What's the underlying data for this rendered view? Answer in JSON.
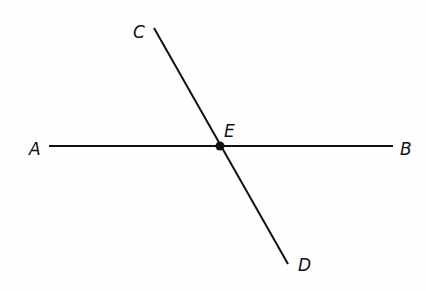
{
  "diagram": {
    "points": {
      "A": {
        "label": "A"
      },
      "B": {
        "label": "B"
      },
      "C": {
        "label": "C"
      },
      "D": {
        "label": "D"
      },
      "E": {
        "label": "E"
      }
    },
    "segments": [
      {
        "from": "A",
        "to": "B"
      },
      {
        "from": "C",
        "to": "D"
      }
    ],
    "intersection": "E",
    "colors": {
      "line": "#111111",
      "background": "#fefefe"
    }
  }
}
